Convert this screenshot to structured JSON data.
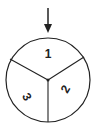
{
  "diagram": {
    "type": "spinner",
    "pointer": "arrow-down",
    "sections": [
      {
        "label": "1",
        "position": "top"
      },
      {
        "label": "2",
        "position": "bottom-right"
      },
      {
        "label": "3",
        "position": "bottom-left"
      }
    ],
    "stroke_color": "#222222",
    "fill_color": "#ffffff"
  }
}
